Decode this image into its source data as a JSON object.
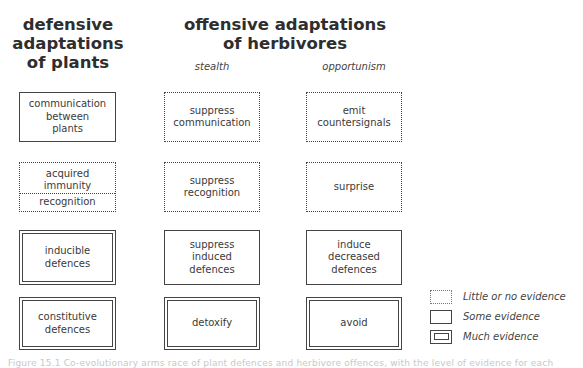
{
  "headings": {
    "plants": "defensive\nadaptations\nof plants",
    "herbivores": "offensive adaptations\nof herbivores"
  },
  "subheadings": {
    "stealth": "stealth",
    "opportunism": "opportunism"
  },
  "rows": [
    {
      "plant": {
        "label": "communication\nbetween\nplants",
        "evidence": "some"
      },
      "stealth": {
        "label": "suppress\ncommunication",
        "evidence": "little"
      },
      "opportunism": {
        "label": "emit\ncountersignals",
        "evidence": "little"
      }
    },
    {
      "plant": {
        "label_top": "acquired\nimmunity",
        "label_bottom": "recognition",
        "evidence": "little"
      },
      "stealth": {
        "label": "suppress\nrecognition",
        "evidence": "little"
      },
      "opportunism": {
        "label": "surprise",
        "evidence": "little"
      }
    },
    {
      "plant": {
        "label": "inducible\ndefences",
        "evidence": "much"
      },
      "stealth": {
        "label": "suppress\ninduced\ndefences",
        "evidence": "some"
      },
      "opportunism": {
        "label": "induce\ndecreased\ndefences",
        "evidence": "some"
      }
    },
    {
      "plant": {
        "label": "constitutive\ndefences",
        "evidence": "much"
      },
      "stealth": {
        "label": "detoxify",
        "evidence": "much"
      },
      "opportunism": {
        "label": "avoid",
        "evidence": "much"
      }
    }
  ],
  "legend": [
    {
      "key": "little",
      "label": "Little or no evidence"
    },
    {
      "key": "some",
      "label": "Some evidence"
    },
    {
      "key": "much",
      "label": "Much evidence"
    }
  ],
  "caption": "Figure 15.1 Co-evolutionary arms race of plant defences and herbivore offences, with the level of evidence for each"
}
